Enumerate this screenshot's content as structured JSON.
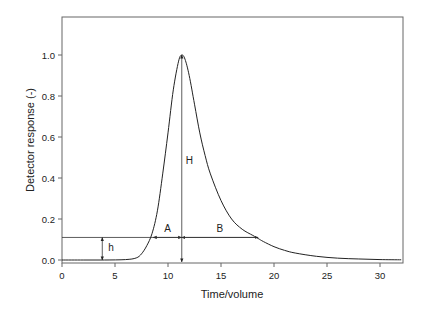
{
  "chart_data": {
    "type": "line",
    "title": "",
    "xlabel": "Time/volume",
    "ylabel": "Detector response (-)",
    "xlim": [
      0,
      32
    ],
    "ylim": [
      -0.02,
      1.18
    ],
    "grid": false,
    "legend": null,
    "x_ticks": [
      0,
      5,
      10,
      15,
      20,
      25,
      30
    ],
    "x_tick_labels": [
      "0",
      "5",
      "10",
      "15",
      "20",
      "25",
      "30"
    ],
    "y_ticks": [
      0.0,
      0.2,
      0.4,
      0.6,
      0.8,
      1.0
    ],
    "y_tick_labels": [
      "0.0",
      "0.2",
      "0.4",
      "0.6",
      "0.8",
      "1.0"
    ],
    "series": [
      {
        "name": "Detector response (tailing peak)",
        "x": [
          0,
          2,
          4,
          6,
          7,
          7.5,
          8,
          8.5,
          9,
          9.5,
          10,
          10.5,
          11,
          11.3,
          11.6,
          12,
          12.5,
          13,
          13.5,
          14,
          15,
          16,
          17,
          18,
          18.5,
          19,
          20,
          21,
          22,
          24,
          26,
          28,
          30,
          32
        ],
        "y": [
          0.0,
          0.0,
          0.0,
          0.002,
          0.01,
          0.03,
          0.07,
          0.13,
          0.24,
          0.42,
          0.62,
          0.83,
          0.97,
          1.0,
          0.98,
          0.9,
          0.76,
          0.62,
          0.51,
          0.42,
          0.29,
          0.2,
          0.15,
          0.12,
          0.105,
          0.09,
          0.065,
          0.047,
          0.034,
          0.018,
          0.009,
          0.005,
          0.002,
          0.001
        ]
      }
    ],
    "annotations": [
      {
        "label": "H",
        "type": "vertical-arrow",
        "x": 11.3,
        "y_from": 0.0,
        "y_to": 1.0,
        "meaning": "peak height"
      },
      {
        "label": "h",
        "type": "vertical-double-arrow",
        "x": 3.8,
        "y_from": 0.0,
        "y_to": 0.11,
        "meaning": "height of measurement line"
      },
      {
        "label": "A",
        "type": "horizontal-double-arrow",
        "y": 0.11,
        "x_from": 8.6,
        "x_to": 11.3,
        "meaning": "front half-width"
      },
      {
        "label": "B",
        "type": "horizontal-double-arrow",
        "y": 0.11,
        "x_from": 11.3,
        "x_to": 18.5,
        "meaning": "back half-width"
      },
      {
        "type": "horizontal-line",
        "y": 0.11,
        "x_from": 0,
        "x_to": 18.5
      }
    ]
  },
  "labels": {
    "xlabel": "Time/volume",
    "ylabel": "Detector response (-)",
    "H": "H",
    "h": "h",
    "A": "A",
    "B": "B"
  },
  "colors": {
    "line": "#222222",
    "frame": "#666666",
    "background": "#ffffff"
  }
}
